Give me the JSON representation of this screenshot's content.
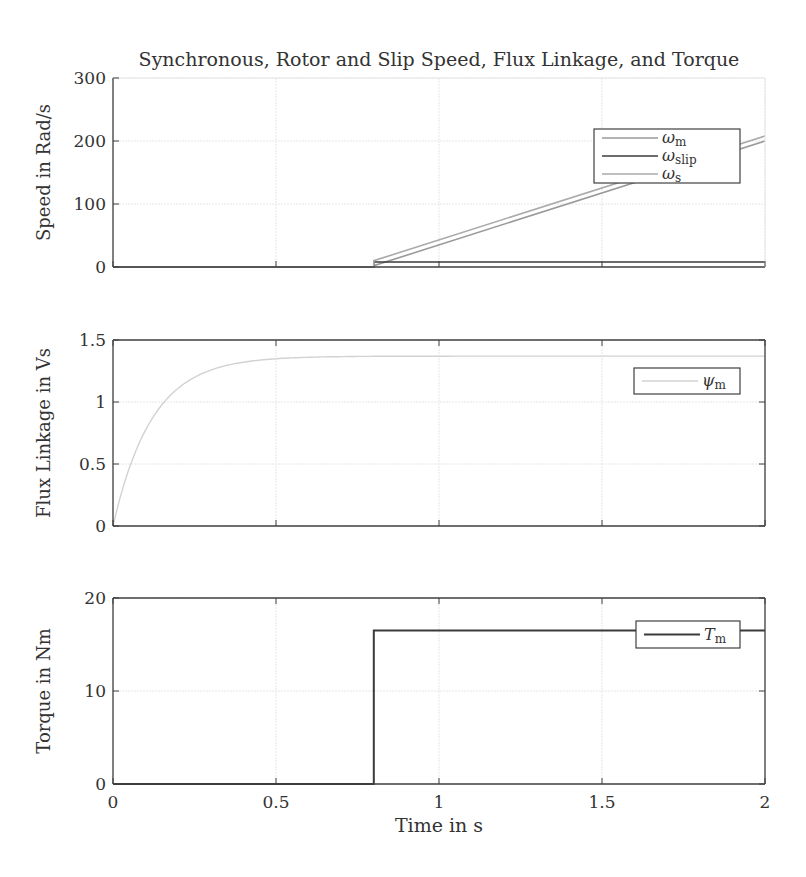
{
  "figure": {
    "title": "Synchronous, Rotor and Slip Speed, Flux Linkage, and Torque",
    "xlabel": "Time in s",
    "xticks": [
      "0",
      "0.5",
      "1",
      "1.5",
      "2"
    ]
  },
  "colors": {
    "axis": "#404040",
    "grid": "#e6e6e6",
    "omega_m": "#9a9a9a",
    "omega_slip": "#3c3c3c",
    "omega_s": "#aaaaaa",
    "psi_m": "#d2d2d2",
    "T_m": "#3a3a3a"
  },
  "chart_data": [
    {
      "type": "line",
      "title": "Synchronous, Rotor and Slip Speed, Flux Linkage, and Torque",
      "xlabel": "",
      "ylabel": "Speed in Rad/s",
      "xlim": [
        0,
        2
      ],
      "ylim": [
        0,
        300
      ],
      "yticks": [
        "0",
        "100",
        "200",
        "300"
      ],
      "grid": true,
      "legend_position": "upper right",
      "series": [
        {
          "name": "ω_m",
          "legend": "ω",
          "sub": "m",
          "x": [
            0,
            0.8,
            0.8,
            2
          ],
          "y": [
            0,
            0,
            2,
            200
          ]
        },
        {
          "name": "ω_slip",
          "legend": "ω",
          "sub": "slip",
          "x": [
            0,
            0.8,
            0.8,
            2
          ],
          "y": [
            0,
            0,
            8,
            8
          ]
        },
        {
          "name": "ω_s",
          "legend": "ω",
          "sub": "s",
          "x": [
            0,
            0.8,
            0.8,
            2
          ],
          "y": [
            0,
            0,
            10,
            208
          ]
        }
      ]
    },
    {
      "type": "line",
      "ylabel": "Flux Linkage in Vs",
      "xlim": [
        0,
        2
      ],
      "ylim": [
        0,
        1.5
      ],
      "yticks": [
        "0",
        "0.5",
        "1",
        "1.5"
      ],
      "grid": true,
      "legend_position": "upper right",
      "series": [
        {
          "name": "ψ_m",
          "legend": "ψ",
          "sub": "m",
          "x": [
            0,
            0.05,
            0.1,
            0.15,
            0.2,
            0.25,
            0.3,
            0.4,
            0.5,
            0.6,
            0.8,
            1.0,
            1.5,
            2.0
          ],
          "y": [
            0,
            0.48,
            0.8,
            1.01,
            1.14,
            1.23,
            1.28,
            1.33,
            1.35,
            1.36,
            1.37,
            1.37,
            1.37,
            1.37
          ]
        }
      ]
    },
    {
      "type": "line",
      "ylabel": "Torque in Nm",
      "xlabel": "Time in s",
      "xlim": [
        0,
        2
      ],
      "ylim": [
        0,
        20
      ],
      "yticks": [
        "0",
        "10",
        "20"
      ],
      "grid": true,
      "legend_position": "upper right",
      "series": [
        {
          "name": "T_m",
          "legend": "T",
          "sub": "m",
          "x": [
            0,
            0.8,
            0.8,
            2
          ],
          "y": [
            0,
            0,
            16.5,
            16.5
          ]
        }
      ]
    }
  ]
}
